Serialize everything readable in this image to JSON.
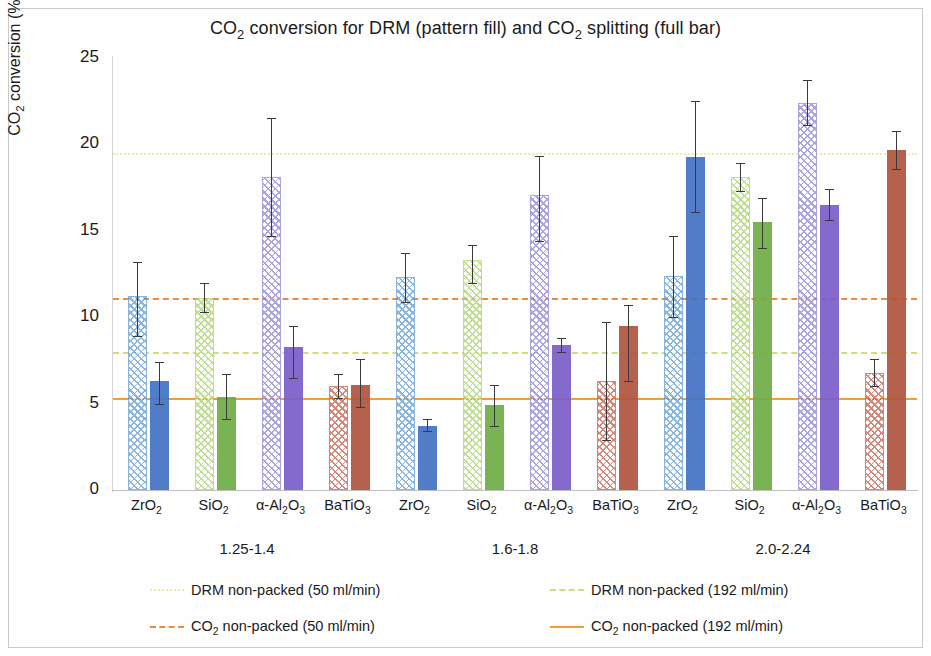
{
  "chart_data": {
    "type": "bar",
    "title": "CO2 conversion for DRM (pattern fill) and CO2 splitting (full bar)",
    "title_parts": [
      "CO",
      "2",
      " conversion for DRM (pattern fill) and CO",
      "2",
      " splitting (full bar)"
    ],
    "xlabel": "",
    "ylabel": "CO2 conversion (%)",
    "ylabel_parts": [
      "CO",
      "2",
      " conversion (%)"
    ],
    "ylim": [
      0,
      25
    ],
    "yticks": [
      0,
      5,
      10,
      15,
      20,
      25
    ],
    "grid": false,
    "legend_position": "bottom",
    "group_axis_label": "",
    "groups": [
      {
        "label": "1.25-1.4"
      },
      {
        "label": "1.6-1.8"
      },
      {
        "label": "2.0-2.24"
      }
    ],
    "categories": [
      "ZrO2",
      "SiO2",
      "a-Al2O3",
      "BaTiO3",
      "ZrO2",
      "SiO2",
      "a-Al2O3",
      "BaTiO3",
      "ZrO2",
      "SiO2",
      "a-Al2O3",
      "BaTiO3"
    ],
    "category_labels": [
      {
        "base": "ZrO",
        "sub1": "2",
        "tail": ""
      },
      {
        "base": "SiO",
        "sub1": "2",
        "tail": ""
      },
      {
        "base": "α-Al",
        "sub1": "2",
        "tail": "O",
        "sub2": "3"
      },
      {
        "base": "BaTiO",
        "sub1": "3",
        "tail": ""
      },
      {
        "base": "ZrO",
        "sub1": "2",
        "tail": ""
      },
      {
        "base": "SiO",
        "sub1": "2",
        "tail": ""
      },
      {
        "base": "α-Al",
        "sub1": "2",
        "tail": "O",
        "sub2": "3"
      },
      {
        "base": "BaTiO",
        "sub1": "3",
        "tail": ""
      },
      {
        "base": "ZrO",
        "sub1": "2",
        "tail": ""
      },
      {
        "base": "SiO",
        "sub1": "2",
        "tail": ""
      },
      {
        "base": "α-Al",
        "sub1": "2",
        "tail": "O",
        "sub2": "3"
      },
      {
        "base": "BaTiO",
        "sub1": "3",
        "tail": ""
      }
    ],
    "series": [
      {
        "name": "DRM (pattern fill)",
        "fill": "pattern",
        "values": [
          11.2,
          11.1,
          18.1,
          6.0,
          12.3,
          13.3,
          17.1,
          6.3,
          12.4,
          18.1,
          22.4,
          6.8
        ],
        "err_upper": [
          2.0,
          0.9,
          3.4,
          0.7,
          1.4,
          0.9,
          2.2,
          3.4,
          2.3,
          0.8,
          1.3,
          0.8
        ],
        "err_lower": [
          2.3,
          0.8,
          3.4,
          0.7,
          1.4,
          1.3,
          2.7,
          3.4,
          2.4,
          0.8,
          1.3,
          0.8
        ],
        "colors": [
          "#5b9bd5",
          "#a9d16c",
          "#8a82d6",
          "#c55a4a",
          "#5b9bd5",
          "#a9d16c",
          "#8a82d6",
          "#c55a4a",
          "#5b9bd5",
          "#a9d16c",
          "#8a82d6",
          "#c55a4a"
        ]
      },
      {
        "name": "CO2 splitting (full bar)",
        "fill": "solid",
        "values": [
          6.3,
          5.4,
          8.3,
          6.1,
          3.7,
          4.9,
          8.4,
          9.5,
          19.3,
          15.5,
          16.5,
          19.7
        ],
        "err_upper": [
          1.1,
          1.3,
          1.2,
          1.5,
          0.4,
          1.2,
          0.4,
          1.2,
          3.2,
          1.4,
          0.9,
          1.1
        ],
        "err_lower": [
          1.3,
          1.3,
          1.8,
          1.3,
          0.3,
          1.2,
          0.4,
          3.2,
          3.2,
          1.5,
          0.9,
          1.1
        ],
        "colors": [
          "#4472c4",
          "#70ad47",
          "#7b5fc9",
          "#b0553f",
          "#4472c4",
          "#70ad47",
          "#7b5fc9",
          "#b0553f",
          "#4472c4",
          "#70ad47",
          "#7b5fc9",
          "#b0553f"
        ]
      }
    ],
    "reference_lines": [
      {
        "id": "drm-50",
        "label": "DRM non-packed (50 ml/min)",
        "value": 19.5,
        "color": "#f2e7b0",
        "style": "dotted"
      },
      {
        "id": "drm-192",
        "label": "DRM non-packed (192 ml/min)",
        "value": 8.0,
        "color": "#c6e37a",
        "style": "dashed"
      },
      {
        "id": "co2-50",
        "label": "CO2 non-packed (50 ml/min)",
        "value": 11.1,
        "color": "#ed8b3c",
        "style": "dashed"
      },
      {
        "id": "co2-192",
        "label": "CO2 non-packed (192 ml/min)",
        "value": 5.3,
        "color": "#f0a030",
        "style": "solid"
      }
    ],
    "legend": [
      {
        "id": "drm-50",
        "base": "DRM non-packed (50 ml/min)",
        "sub": "",
        "tail": ""
      },
      {
        "id": "drm-192",
        "base": "DRM non-packed (192 ml/min)",
        "sub": "",
        "tail": ""
      },
      {
        "id": "co2-50",
        "base": "CO",
        "sub": "2",
        "tail": " non-packed (50 ml/min)"
      },
      {
        "id": "co2-192",
        "base": "CO",
        "sub": "2",
        "tail": " non-packed (192 ml/min)"
      }
    ]
  }
}
